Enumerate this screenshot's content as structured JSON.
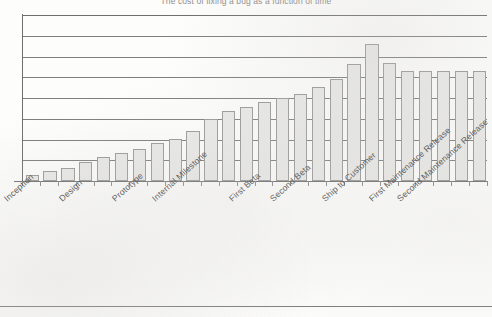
{
  "document": {
    "kind": "scanned-figure-page",
    "bottom_rule_visible": true
  },
  "chart_data": {
    "type": "bar",
    "title": "The cost of fixing a bug as a function of time",
    "xlabel": "",
    "ylabel": "",
    "grid": true,
    "legend": "none",
    "ylim": [
      0,
      9
    ],
    "yticks": [
      0,
      1,
      2,
      3,
      4,
      5,
      6,
      7,
      8
    ],
    "ytick_labels_visible": false,
    "gridline_count": 9,
    "category_labels": [
      "Inception",
      "Design",
      "Prototype",
      "Internal Milestone",
      "First Beta",
      "Second Beta",
      "Ship to Customer",
      "First Maintenance Release",
      "Second Maintenance Release"
    ],
    "category_label_rotation_deg": -42,
    "bar_count": 26,
    "values": [
      0.3,
      0.55,
      0.72,
      1.02,
      1.3,
      1.5,
      1.72,
      2.05,
      2.3,
      2.7,
      3.35,
      3.8,
      4.0,
      4.3,
      4.5,
      4.72,
      5.1,
      5.55,
      6.35,
      7.45,
      6.4,
      5.95,
      5.95,
      5.95,
      5.95,
      5.95
    ],
    "value_labels_visible": false,
    "bar_fill_color": "#e9e9e7",
    "bar_edge_color": "#9a9a9a",
    "axis_color": "#6f6f6f",
    "gridline_color": "#7e7e7e",
    "title_color": "#8d8d8d",
    "background_color": "#fdfdfc"
  }
}
